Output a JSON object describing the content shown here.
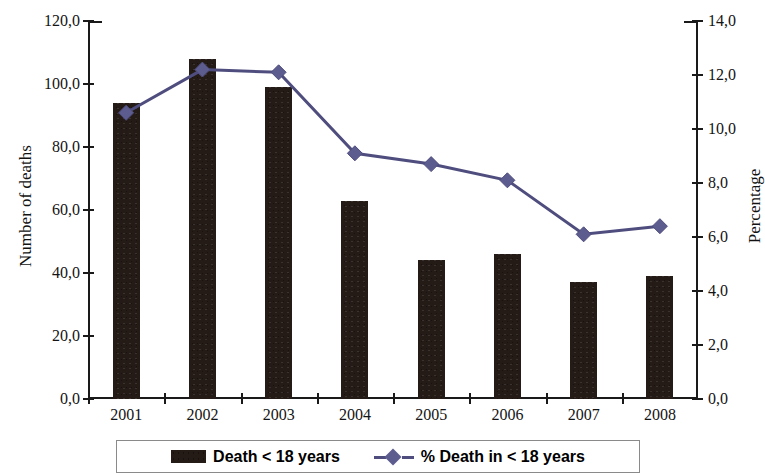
{
  "chart_data": {
    "type": "bar",
    "title": "",
    "subtitle": "",
    "xlabel": "",
    "ylabel": "Number of deaths",
    "y2label": "Percentage",
    "categories": [
      "2001",
      "2002",
      "2003",
      "2004",
      "2005",
      "2006",
      "2007",
      "2008"
    ],
    "ylim": [
      0,
      120
    ],
    "y2lim": [
      0,
      14
    ],
    "yticks": [
      "0,0",
      "20,0",
      "40,0",
      "60,0",
      "80,0",
      "100,0",
      "120,0"
    ],
    "ytick_values": [
      0,
      20,
      40,
      60,
      80,
      100,
      120
    ],
    "y2ticks": [
      "0,0",
      "2,0",
      "4,0",
      "6,0",
      "8,0",
      "10,0",
      "12,0",
      "14,0"
    ],
    "y2tick_values": [
      0,
      2,
      4,
      6,
      8,
      10,
      12,
      14
    ],
    "grid": false,
    "legend_position": "bottom",
    "series": [
      {
        "name": "Death < 18 years",
        "type": "bar",
        "axis": "left",
        "color": "#241b16",
        "values": [
          94,
          108,
          99,
          63,
          44,
          46,
          37,
          39
        ]
      },
      {
        "name": "% Death in < 18 years",
        "type": "line",
        "axis": "right",
        "color": "#5d5c8e",
        "marker": "diamond",
        "values": [
          10.6,
          12.2,
          12.1,
          9.1,
          8.7,
          8.1,
          6.1,
          6.4
        ]
      }
    ]
  },
  "legend": {
    "items": [
      {
        "label": "Death < 18 years",
        "swatch": "bar-swatch"
      },
      {
        "label": "% Death in < 18 years",
        "swatch": "line-marker-swatch"
      }
    ]
  },
  "colors": {
    "bar": "#241b16",
    "line": "#4e4d7e",
    "marker": "#5d5c8e",
    "axis": "#1a1a1a",
    "text": "#121212",
    "legend_border": "#8a8a8a"
  }
}
